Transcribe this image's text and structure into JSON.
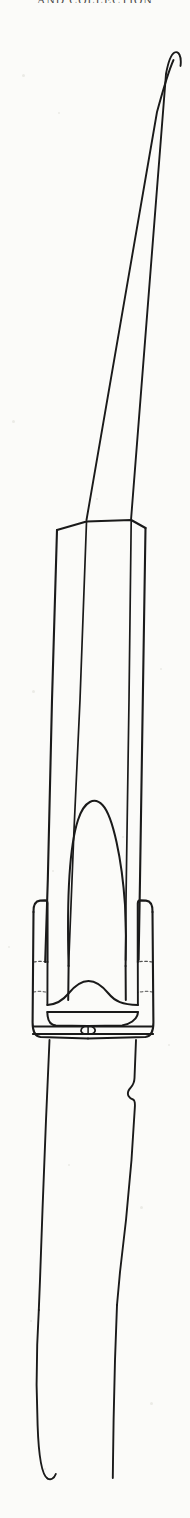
{
  "page": {
    "width": 190,
    "height": 1518,
    "background_color": "#fbfbf9",
    "ink_color": "#1a1a1a",
    "header_text": "AND COLLECTION"
  },
  "figure": {
    "name": "artifact-line-drawing",
    "orientation": "vertical",
    "stroke_color": "#1a1a1a",
    "fill_color": "none",
    "parts": [
      {
        "label": "blade-tip",
        "y_top": 52,
        "y_bottom": 268
      },
      {
        "label": "blade-body",
        "y_top": 268,
        "y_bottom": 520
      },
      {
        "label": "mid-band",
        "y_top": 520,
        "y_bottom": 1010
      },
      {
        "label": "central-dome",
        "y_top": 806,
        "y_bottom": 1010
      },
      {
        "label": "collar-flange-left",
        "y_top": 900,
        "y_bottom": 1040
      },
      {
        "label": "collar-flange-right",
        "y_top": 900,
        "y_bottom": 1040
      },
      {
        "label": "wavy-band",
        "y_top": 985,
        "y_bottom": 1020
      },
      {
        "label": "rivet",
        "y_top": 1030,
        "y_bottom": 1048
      },
      {
        "label": "tang",
        "y_top": 1048,
        "y_bottom": 1300
      },
      {
        "label": "tang-notch",
        "y_top": 1095,
        "y_bottom": 1125
      },
      {
        "label": "tang-point",
        "y_top": 1300,
        "y_bottom": 1478
      }
    ]
  },
  "paper_specks": [
    {
      "x": 22,
      "y": 74,
      "size": 3
    },
    {
      "x": 58,
      "y": 112,
      "size": 2
    },
    {
      "x": 12,
      "y": 420,
      "size": 3
    },
    {
      "x": 96,
      "y": 498,
      "size": 2
    },
    {
      "x": 32,
      "y": 690,
      "size": 3
    },
    {
      "x": 160,
      "y": 668,
      "size": 2
    },
    {
      "x": 52,
      "y": 870,
      "size": 2
    },
    {
      "x": 122,
      "y": 836,
      "size": 2
    },
    {
      "x": 68,
      "y": 1164,
      "size": 2
    },
    {
      "x": 140,
      "y": 1206,
      "size": 3
    },
    {
      "x": 30,
      "y": 1320,
      "size": 2
    },
    {
      "x": 150,
      "y": 1402,
      "size": 3
    },
    {
      "x": 44,
      "y": 1468,
      "size": 2
    },
    {
      "x": 168,
      "y": 1044,
      "size": 2
    },
    {
      "x": 8,
      "y": 946,
      "size": 2
    }
  ]
}
